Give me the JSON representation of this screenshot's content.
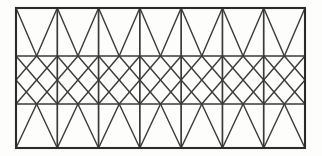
{
  "figure": {
    "name": "triangulated-lattice-truss-panel",
    "background_color": "#fdfdfc",
    "line_color": "#3a3a3a",
    "frame_color": "#2b2b2b"
  },
  "geometry": {
    "frame": {
      "left": 16,
      "right": 305,
      "top": 8,
      "bottom": 148,
      "width": 289,
      "height": 140
    },
    "horizontal_lines_y": [
      8,
      56,
      104,
      148
    ],
    "row_count": 3,
    "bay_count": 7,
    "bay_width": 41.29,
    "vertical_lines_x": [
      16,
      57.29,
      98.57,
      139.86,
      181.14,
      222.43,
      263.71,
      305
    ],
    "midpoints_x": [
      36.64,
      77.93,
      119.21,
      160.5,
      201.79,
      243.07,
      284.36
    ],
    "row_bands": [
      {
        "index": 0,
        "label": "top-band",
        "y_top": 8,
        "y_bottom": 56,
        "pattern": "vee-zigzag",
        "apex_position": "bottom-midpoint"
      },
      {
        "index": 1,
        "label": "middle-band",
        "y_top": 56,
        "y_bottom": 104,
        "pattern": "diamond-lattice",
        "apex_position": "left-and-right-midpoint"
      },
      {
        "index": 2,
        "label": "bottom-band",
        "y_top": 104,
        "y_bottom": 148,
        "pattern": "lambda-zigzag",
        "apex_position": "top-midpoint"
      }
    ]
  },
  "chart_data": {
    "type": "diagram",
    "title": "",
    "subtitle": "",
    "xlabel": "",
    "ylabel": "",
    "grid": true,
    "legend": [],
    "annotations": [],
    "series": [
      {
        "name": "outer-frame",
        "kind": "rectangle",
        "values": [
          16,
          8,
          305,
          148
        ]
      },
      {
        "name": "horizontal-dividers",
        "kind": "hline",
        "values": [
          56,
          104
        ]
      },
      {
        "name": "vertical-members",
        "kind": "vline",
        "values": [
          57.29,
          98.57,
          139.86,
          181.14,
          222.43,
          263.71
        ]
      }
    ]
  }
}
